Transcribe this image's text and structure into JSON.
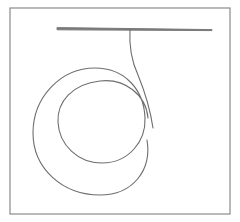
{
  "drawing": {
    "description": "Line drawing of a horizontal bar with a string hanging from it that coils into a spiral loop, inside a rectangular frame",
    "colors": {
      "background": "#ffffff",
      "frame": "#8a8a8a",
      "bar": "#7a7a7a",
      "string": "#6e6e6e"
    },
    "frame": {
      "x": 10,
      "y": 8,
      "width": 220,
      "height": 206
    },
    "bar": {
      "x1": 57,
      "y1": 28,
      "x2": 212,
      "y2": 31
    },
    "string_path": "M 130 29 C 129 45, 131 60, 138 75 C 145 92, 150 108, 153 128 M 148 118 C 146 95, 125 78, 100 81 C 72 84, 57 102, 58 122 C 59 145, 78 163, 102 163 C 128 163, 146 142, 145 118 C 144 90, 125 68, 95 68 C 60 68, 33 98, 33 133 C 33 168, 62 195, 100 195 C 133 195, 152 170, 147 140"
  }
}
